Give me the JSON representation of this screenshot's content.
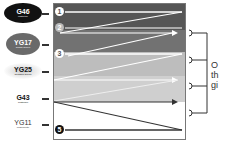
{
  "swatches": [
    {
      "code": "G46",
      "name": "Mistletoe",
      "bg": "#111111",
      "fg": "#ffffff"
    },
    {
      "code": "YG17",
      "name": "Grass Green",
      "bg": "#6a6a6a",
      "fg": "#ffffff"
    },
    {
      "code": "YG25",
      "name": "Celadon Green",
      "bg": "#d8d8d8",
      "fg": "#111111"
    },
    {
      "code": "G43",
      "name": "Pistachio",
      "bg": "#ffffff",
      "fg": "#111111"
    },
    {
      "code": "YG11",
      "name": "Mignonette",
      "bg": "#ffffff",
      "fg": "#333333"
    }
  ],
  "steps": [
    {
      "label": "1"
    },
    {
      "label": "2"
    },
    {
      "label": "3"
    },
    {
      "label": "5"
    }
  ],
  "bands": [
    {
      "color": "#565656"
    },
    {
      "color": "#727272"
    },
    {
      "color": "#bdbdbd"
    },
    {
      "color": "#cfcfcf"
    },
    {
      "color": "#ffffff"
    }
  ],
  "caption": {
    "line1": "O",
    "line2": "th",
    "line3": "gi"
  }
}
